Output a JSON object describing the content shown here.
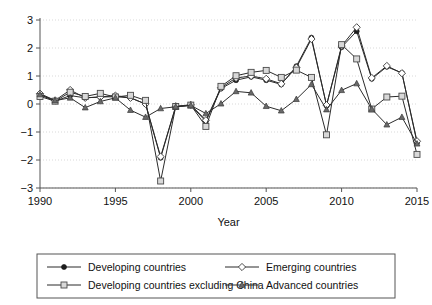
{
  "chart_data": {
    "type": "line",
    "title": "",
    "xlabel": "Year",
    "ylabel": "",
    "xlim": [
      1990,
      2015
    ],
    "ylim": [
      -3,
      3
    ],
    "grid": true,
    "legend_position": "bottom",
    "x": [
      1990,
      1991,
      1992,
      1993,
      1994,
      1995,
      1996,
      1997,
      1998,
      1999,
      2000,
      2001,
      2002,
      2003,
      2004,
      2005,
      2006,
      2007,
      2008,
      2009,
      2010,
      2011,
      2012,
      2013,
      2014,
      2015
    ],
    "xticks": [
      "1990",
      "1995",
      "2000",
      "2005",
      "2010",
      "2015"
    ],
    "yticks": [
      "3",
      "2",
      "1",
      "0",
      "−1",
      "−2",
      "−3"
    ],
    "series": [
      {
        "name": "Developing countries",
        "marker": "filled-circle",
        "values": [
          0.33,
          0.1,
          0.3,
          0.22,
          0.25,
          0.26,
          0.22,
          0.0,
          -1.92,
          -0.1,
          -0.05,
          -0.62,
          0.55,
          0.85,
          0.97,
          0.85,
          0.7,
          1.35,
          2.37,
          -0.05,
          2.03,
          2.6,
          0.9,
          1.33,
          1.11,
          -1.38
        ]
      },
      {
        "name": "Emerging countries",
        "marker": "open-diamond",
        "values": [
          0.37,
          0.13,
          0.5,
          0.22,
          0.25,
          0.3,
          0.22,
          0.0,
          -1.88,
          -0.08,
          -0.03,
          -0.58,
          0.58,
          0.93,
          1.0,
          0.9,
          0.72,
          1.3,
          2.32,
          -0.04,
          2.07,
          2.74,
          0.93,
          1.36,
          1.1,
          -1.33
        ]
      },
      {
        "name": "Developing countries excluding China",
        "marker": "open-square",
        "values": [
          0.27,
          0.1,
          0.42,
          0.27,
          0.38,
          0.25,
          0.31,
          0.13,
          -2.75,
          -0.09,
          -0.04,
          -0.8,
          0.63,
          1.01,
          1.13,
          1.2,
          0.95,
          1.21,
          0.95,
          -1.1,
          2.12,
          1.61,
          -0.18,
          0.25,
          0.28,
          -1.8
        ]
      },
      {
        "name": "Advanced countries",
        "marker": "filled-triangle",
        "values": [
          0.34,
          0.12,
          0.22,
          -0.13,
          0.09,
          0.22,
          -0.22,
          -0.47,
          -0.16,
          -0.1,
          -0.05,
          -0.34,
          0.01,
          0.45,
          0.4,
          -0.08,
          -0.24,
          0.17,
          0.7,
          -0.2,
          0.49,
          0.73,
          -0.18,
          -0.74,
          -0.47,
          -1.42
        ]
      }
    ]
  },
  "legend": {
    "entries": [
      {
        "label": "Developing countries",
        "marker": "filled-circle"
      },
      {
        "label": "Emerging countries",
        "marker": "open-diamond"
      },
      {
        "label": "Developing countries excluding China",
        "marker": "open-square"
      },
      {
        "label": "Advanced countries",
        "marker": "filled-triangle"
      }
    ]
  }
}
